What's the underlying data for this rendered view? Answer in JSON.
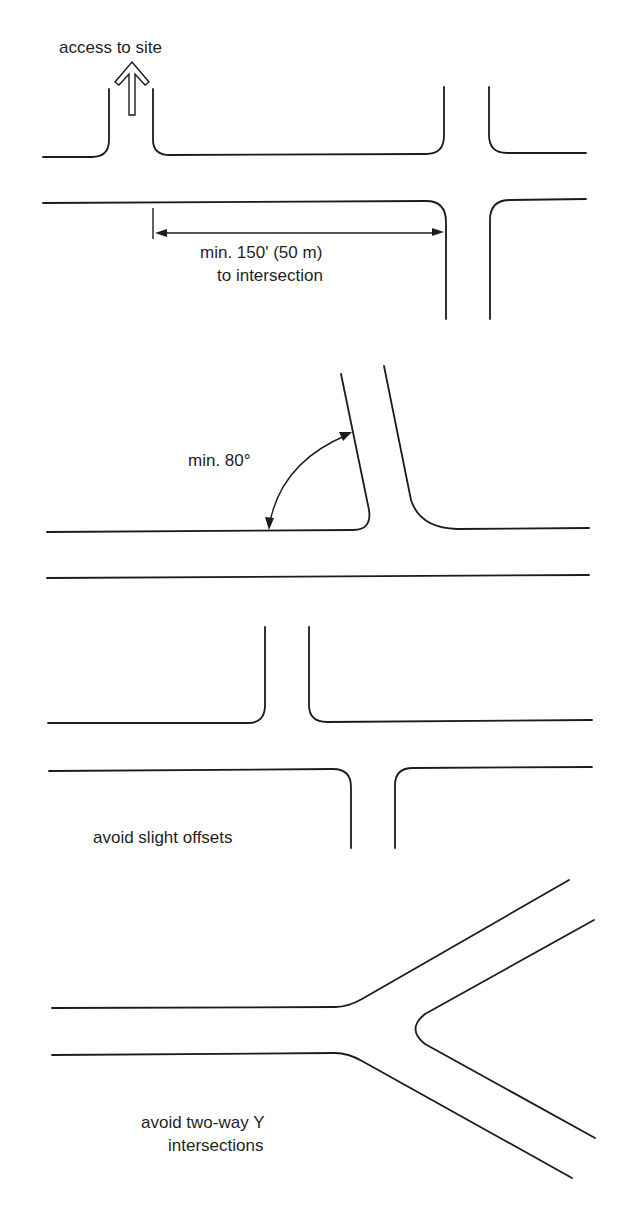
{
  "figure": {
    "panels": [
      {
        "id": "access-spacing",
        "labels": {
          "access": "access to site",
          "dimension_line1": "min. 150' (50 m)",
          "dimension_line2": "to intersection"
        }
      },
      {
        "id": "angle",
        "labels": {
          "angle": "min. 80°"
        }
      },
      {
        "id": "offsets",
        "labels": {
          "caption": "avoid slight offsets"
        }
      },
      {
        "id": "y-intersection",
        "labels": {
          "caption_line1": "avoid two-way Y",
          "caption_line2": "intersections"
        }
      }
    ],
    "colors": {
      "line": "#1c1c1c",
      "background": "#ffffff"
    }
  }
}
